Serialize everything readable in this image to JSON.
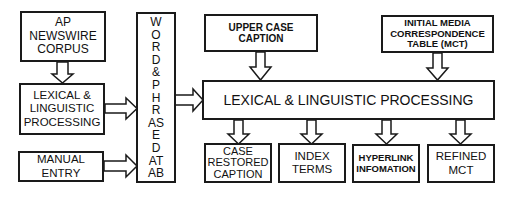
{
  "diagram": {
    "sources": {
      "ap_newswire": "AP NEWSWIRE\nCORPUS",
      "lexical_left": "LEXICAL &\nLINGUISTIC\nPROCESSING",
      "manual_entry": "MANUAL\nENTRY"
    },
    "database": {
      "letters": [
        "W",
        "O",
        "R",
        "D",
        "&",
        "P",
        "H",
        "R",
        "AS",
        "E",
        "D",
        "AT",
        "AB"
      ]
    },
    "inputs": {
      "upper_case_caption": "UPPER CASE\nCAPTION",
      "initial_mct": "INITIAL MEDIA\nCORRESPONDENCE\nTABLE (MCT)"
    },
    "main_process": "LEXICAL & LINGUISTIC PROCESSING",
    "outputs": {
      "case_restored_caption": "CASE\nRESTORED\nCAPTION",
      "index_terms": "INDEX\nTERMS",
      "hyperlink_information": "HYPERLINK\nINFOMATION",
      "refined_mct": "REFINED\nMCT"
    },
    "colors": {
      "stroke": "#1a1a1a",
      "fill": "#ffffff"
    }
  }
}
